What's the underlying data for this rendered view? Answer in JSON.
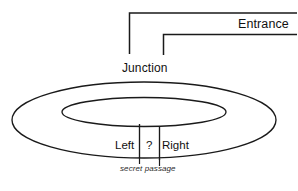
{
  "diagram": {
    "background_color": "#ffffff",
    "stroke_color": "#1a1a1a",
    "labels": {
      "entrance": "Entrance",
      "junction": "Junction",
      "left": "Left",
      "question": "?",
      "right": "Right",
      "secret_passage": "secret passage"
    },
    "geometry": {
      "outer_ellipse": {
        "cx": 144,
        "cy": 120,
        "rx": 132,
        "ry": 38
      },
      "inner_ellipse": {
        "cx": 144,
        "cy": 112,
        "rx": 82,
        "ry": 14
      },
      "entrance_corridor": {
        "outer_wall": "M 289 13 L 129 13 L 129 53",
        "inner_wall": "M 289 34 L 163 34 L 163 53"
      },
      "passage_dividers": [
        {
          "x": 139,
          "y1": 124,
          "y2": 157
        },
        {
          "x": 159,
          "y1": 126,
          "y2": 160
        }
      ],
      "secret_passage_marks": [
        {
          "x1": 139,
          "y1": 160,
          "x2": 139,
          "y2": 166
        },
        {
          "x1": 159,
          "y1": 162,
          "x2": 159,
          "y2": 168
        }
      ]
    }
  }
}
